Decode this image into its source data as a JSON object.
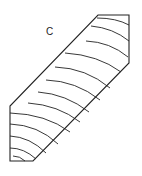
{
  "figure": {
    "label": "C",
    "stroke_color": "#222222",
    "background": "#ffffff",
    "outline": [
      [
        98,
        15
      ],
      [
        129,
        15
      ],
      [
        129,
        63
      ],
      [
        33,
        161
      ],
      [
        10,
        161
      ],
      [
        10,
        106
      ]
    ],
    "grain_lines": [
      {
        "from": [
          97,
          18
        ],
        "ctrl": [
          116,
          18
        ],
        "to": [
          129,
          25
        ]
      },
      {
        "from": [
          91,
          26
        ],
        "ctrl": [
          113,
          28
        ],
        "to": [
          129,
          41
        ]
      },
      {
        "from": [
          86,
          41
        ],
        "ctrl": [
          110,
          42
        ],
        "to": [
          128,
          57
        ]
      },
      {
        "from": [
          65,
          53
        ],
        "ctrl": [
          98,
          55
        ],
        "to": [
          121,
          72
        ]
      },
      {
        "from": [
          55,
          67
        ],
        "ctrl": [
          86,
          68
        ],
        "to": [
          110,
          88
        ]
      },
      {
        "from": [
          46,
          80
        ],
        "ctrl": [
          76,
          81
        ],
        "to": [
          100,
          100
        ]
      },
      {
        "from": [
          38,
          92
        ],
        "ctrl": [
          66,
          94
        ],
        "to": [
          89,
          112
        ]
      },
      {
        "from": [
          28,
          103
        ],
        "ctrl": [
          58,
          105
        ],
        "to": [
          80,
          122
        ]
      },
      {
        "from": [
          10,
          113
        ],
        "ctrl": [
          46,
          114
        ],
        "to": [
          70,
          132
        ]
      },
      {
        "from": [
          10,
          124
        ],
        "ctrl": [
          38,
          125
        ],
        "to": [
          58,
          144
        ]
      },
      {
        "from": [
          10,
          136
        ],
        "ctrl": [
          30,
          137
        ],
        "to": [
          46,
          153
        ]
      },
      {
        "from": [
          10,
          148
        ],
        "ctrl": [
          24,
          148
        ],
        "to": [
          36,
          159
        ]
      },
      {
        "from": [
          13,
          156
        ],
        "ctrl": [
          20,
          156
        ],
        "to": [
          25,
          161
        ]
      }
    ]
  }
}
